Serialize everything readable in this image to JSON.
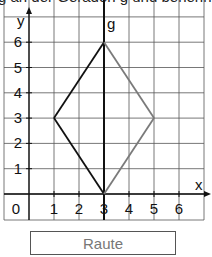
{
  "instruction_text_fragment": "g an der Geraden g und benenne d",
  "chart_data": {
    "type": "diagram",
    "title": "",
    "xlabel": "x",
    "ylabel": "y",
    "line_label": "g",
    "x_ticks": [
      "1",
      "2",
      "3",
      "4",
      "5",
      "6"
    ],
    "y_ticks": [
      "1",
      "2",
      "3",
      "4",
      "5",
      "6"
    ],
    "origin_label": "0",
    "xlim": [
      -1,
      7
    ],
    "ylim": [
      -1,
      7
    ],
    "grid": true,
    "mirror_line": {
      "name": "g",
      "x": 3
    },
    "shape": {
      "name": "Raute",
      "vertices": [
        [
          3,
          6
        ],
        [
          1,
          3
        ],
        [
          3,
          0
        ],
        [
          5,
          3
        ]
      ],
      "original_edges": [
        [
          [
            3,
            6
          ],
          [
            1,
            3
          ]
        ],
        [
          [
            1,
            3
          ],
          [
            3,
            0
          ]
        ]
      ],
      "mirrored_edges": [
        [
          [
            3,
            6
          ],
          [
            5,
            3
          ]
        ],
        [
          [
            5,
            3
          ],
          [
            3,
            0
          ]
        ]
      ]
    },
    "colors": {
      "original": "#111111",
      "mirrored": "#7a7a7a",
      "grid": "#555555"
    }
  },
  "answer_box": {
    "label": "Raute"
  }
}
